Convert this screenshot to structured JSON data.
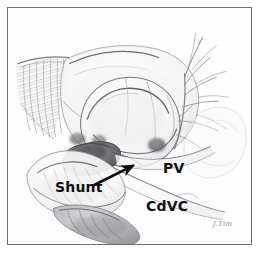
{
  "figure": {
    "kind": "pencil-medical-illustration",
    "frame": {
      "border_color": "#6f6f72",
      "background_color": "#fefefe",
      "border_width_px": 1
    },
    "media": {
      "technique": "graphite pencil drawing",
      "paper_color": "#ffffff",
      "line_color": "#6b6b70",
      "shadow_color": "#3c3c40"
    }
  },
  "labels": [
    {
      "id": "shunt",
      "text": "Shunt",
      "x": 47,
      "y": 172,
      "color": "#101010",
      "font_size": 14
    },
    {
      "id": "pv",
      "text": "PV",
      "x": 155,
      "y": 153,
      "color": "#101010",
      "font_size": 14
    },
    {
      "id": "cdvc",
      "text": "CdVC",
      "x": 138,
      "y": 191,
      "color": "#101010",
      "font_size": 14
    }
  ],
  "annotations": {
    "arrow": {
      "name": "shunt-pointer-arrow",
      "color": "#0a0a0a",
      "from_x": 93,
      "from_y": 186,
      "to_x": 133,
      "to_y": 166,
      "stroke_width": 2.6
    }
  },
  "signature": {
    "text": "J.Tim",
    "x": 205,
    "y": 212,
    "color": "#8d8d92"
  },
  "anatomy": {
    "structures": [
      {
        "name": "diaphragm-hatching",
        "note": "hatched crescent, upper left"
      },
      {
        "name": "liver-lobe-outline",
        "note": "large pale lobe, upper center"
      },
      {
        "name": "stomach-body",
        "note": "central rounded mass"
      },
      {
        "name": "shunt-vessel",
        "note": "dark shaded ovoid vessel, left of center"
      },
      {
        "name": "portal-vein",
        "note": "vessel running to the right, labelled PV"
      },
      {
        "name": "caudal-vena-cava",
        "note": "long vessel sweeping lower right, labelled CdVC"
      },
      {
        "name": "mesenteric-vessel-branches",
        "note": "fine branching vessels, upper right"
      },
      {
        "name": "kidney-lobe",
        "note": "lower left shaded lobe"
      },
      {
        "name": "intestinal-loop",
        "note": "lower center shaded loop"
      }
    ]
  }
}
